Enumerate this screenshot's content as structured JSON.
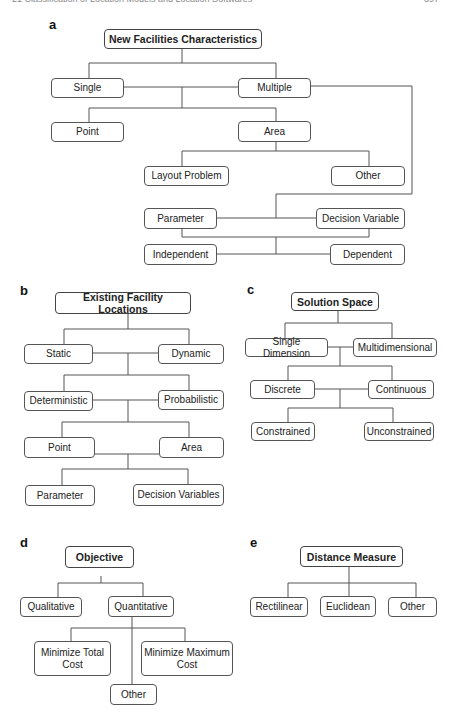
{
  "header": {
    "running_title": "21   Classification of Location Models and Location Softwares",
    "page_number": "397"
  },
  "panels": {
    "a": {
      "label": "a",
      "root": "New Facilities Characteristics",
      "nodes": {
        "single": "Single",
        "multiple": "Multiple",
        "point": "Point",
        "area": "Area",
        "layout_problem": "Layout Problem",
        "other": "Other",
        "parameter": "Parameter",
        "decision_variable": "Decision Variable",
        "independent": "Independent",
        "dependent": "Dependent"
      }
    },
    "b": {
      "label": "b",
      "root": "Existing Facility Locations",
      "nodes": {
        "static": "Static",
        "dynamic": "Dynamic",
        "deterministic": "Deterministic",
        "probabilistic": "Probabilistic",
        "point": "Point",
        "area": "Area",
        "parameter": "Parameter",
        "decision_variables": "Decision Variables"
      }
    },
    "c": {
      "label": "c",
      "root": "Solution Space",
      "nodes": {
        "single_dimension": "Single Dimension",
        "multidimensional": "Multidimensional",
        "discrete": "Discrete",
        "continuous": "Continuous",
        "constrained": "Constrained",
        "unconstrained": "Unconstrained"
      }
    },
    "d": {
      "label": "d",
      "root": "Objective",
      "nodes": {
        "qualitative": "Qualitative",
        "quantitative": "Quantitative",
        "min_total_cost": "Minimize Total Cost",
        "min_max_cost": "Minimize Maximum Cost",
        "other": "Other"
      }
    },
    "e": {
      "label": "e",
      "root": "Distance Measure",
      "nodes": {
        "rectilinear": "Rectilinear",
        "euclidean": "Euclidean",
        "other": "Other"
      }
    }
  }
}
